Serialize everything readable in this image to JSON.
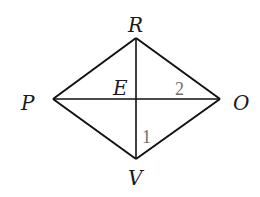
{
  "diagram": {
    "type": "rhombus-with-diagonals",
    "vertices": {
      "R": {
        "label": "R",
        "x": 136,
        "y": 38
      },
      "P": {
        "label": "P",
        "x": 53,
        "y": 99
      },
      "O": {
        "label": "O",
        "x": 220,
        "y": 99
      },
      "V": {
        "label": "V",
        "x": 136,
        "y": 159
      }
    },
    "intersection": {
      "label": "E",
      "x": 136,
      "y": 99
    },
    "angle_labels": {
      "angle1": "1",
      "angle2": "2"
    },
    "colors": {
      "lines": "#111111",
      "vertex_labels": "#1a1a1a",
      "angle_labels": "#6e6e6e",
      "background": "#ffffff"
    }
  }
}
